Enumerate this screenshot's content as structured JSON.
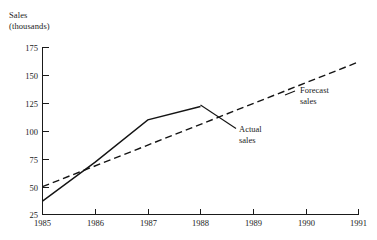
{
  "chart_data": {
    "type": "line",
    "title": "",
    "ylabel": "Sales (thousands)",
    "ylabel_lines": [
      "Sales",
      "(thousands)"
    ],
    "xlabel": "",
    "x": [
      1985,
      1986,
      1987,
      1988,
      1989,
      1990,
      1991
    ],
    "xtick_labels": [
      "1985",
      "1986",
      "1987",
      "1988",
      "1989",
      "1990",
      "1991"
    ],
    "ytick_labels": [
      "25",
      "50",
      "75",
      "100",
      "125",
      "150",
      "175"
    ],
    "ytick_values": [
      25,
      50,
      75,
      100,
      125,
      150,
      175
    ],
    "ylim": [
      25,
      175
    ],
    "xlim": [
      1985,
      1991
    ],
    "grid": false,
    "legend_position": "inline-annotations",
    "series": [
      {
        "name": "Actual sales",
        "style": "solid",
        "x": [
          1985,
          1986,
          1987,
          1988
        ],
        "values": [
          37,
          72,
          110,
          122
        ]
      },
      {
        "name": "Forecast sales",
        "style": "dashed",
        "x": [
          1985,
          1991
        ],
        "values": [
          50,
          162
        ]
      }
    ],
    "annotations": [
      {
        "label_lines": [
          "Actual",
          "sales"
        ],
        "label": "Actual sales",
        "target_series": "Actual sales"
      },
      {
        "label_lines": [
          "Forecast",
          "sales"
        ],
        "label": "Forecast sales",
        "target_series": "Forecast sales"
      }
    ]
  },
  "axis": {
    "y_ticks": [
      {
        "label": "175"
      },
      {
        "label": "150"
      },
      {
        "label": "125"
      },
      {
        "label": "100"
      },
      {
        "label": "75"
      },
      {
        "label": "50"
      },
      {
        "label": "25"
      }
    ],
    "x_ticks": [
      {
        "label": "1985"
      },
      {
        "label": "1986"
      },
      {
        "label": "1987"
      },
      {
        "label": "1988"
      },
      {
        "label": "1989"
      },
      {
        "label": "1990"
      },
      {
        "label": "1991"
      }
    ]
  },
  "labels": {
    "y_axis_line1": "Sales",
    "y_axis_line2": "(thousands)",
    "actual_line1": "Actual",
    "actual_line2": "sales",
    "forecast_line1": "Forecast",
    "forecast_line2": "sales"
  },
  "colors": {
    "ink": "#141414",
    "background": "#ffffff"
  }
}
